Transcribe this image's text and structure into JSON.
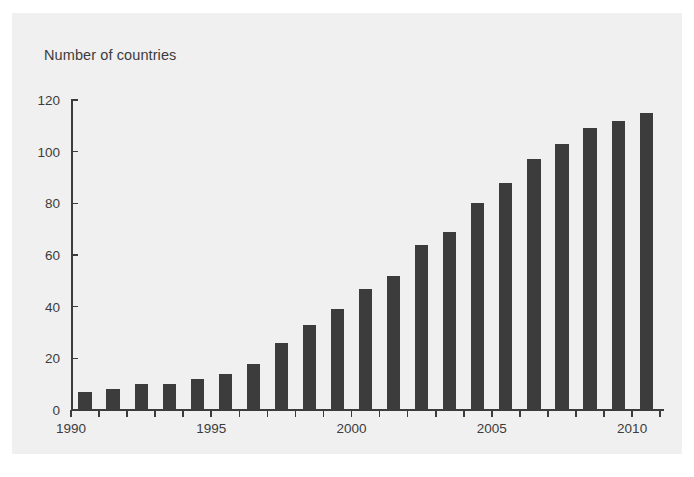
{
  "figure": {
    "background_color": "#ffffff",
    "panel_color": "#f0f0f0",
    "bar_color": "#3c3c3c",
    "axis_color": "#3c3c3c"
  },
  "chart_data": {
    "type": "bar",
    "title": "Number of countries",
    "xlabel": "",
    "ylabel": "",
    "ylim": [
      0,
      120
    ],
    "xlim": [
      1990,
      2011
    ],
    "grid": false,
    "legend": null,
    "y_ticks": [
      0,
      20,
      40,
      60,
      80,
      100,
      120
    ],
    "y_tick_labels": [
      "0",
      "20",
      "40",
      "60",
      "80",
      "100",
      "120"
    ],
    "x_tick_labels": [
      "1990",
      "1995",
      "2000",
      "2005",
      "2010"
    ],
    "x_tick_values": [
      1990,
      1995,
      2000,
      2005,
      2010
    ],
    "categories": [
      "1990",
      "1991",
      "1992",
      "1993",
      "1994",
      "1995",
      "1996",
      "1997",
      "1998",
      "1999",
      "2000",
      "2001",
      "2002",
      "2003",
      "2004",
      "2005",
      "2006",
      "2007",
      "2008",
      "2009",
      "2010"
    ],
    "values": [
      7,
      8,
      10,
      10,
      12,
      14,
      18,
      26,
      33,
      39,
      47,
      52,
      64,
      69,
      80,
      88,
      97,
      103,
      109,
      112,
      115
    ]
  }
}
